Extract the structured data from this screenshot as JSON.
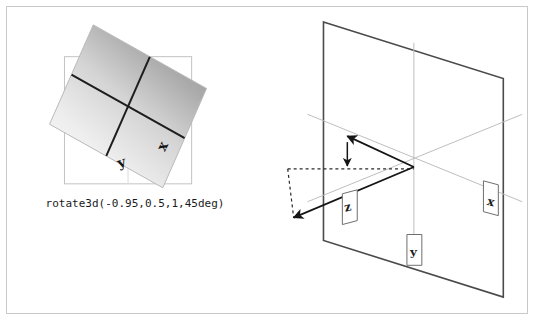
{
  "page": {
    "width": 534,
    "height": 320,
    "background_color": "#ffffff",
    "frame_border_color": "#c9c9c9"
  },
  "colors": {
    "axis_line": "#1a1a1a",
    "plane_outline": "#3a3a3a",
    "guide_line": "#b0b0b0",
    "reference_square": "#c0c0c0",
    "gradient_dark": "#9b9b9b",
    "gradient_light": "#fbfbfb",
    "dashed_line": "#2b2b2b",
    "label_box_fill": "#ffffff",
    "label_box_border": "#6e6e6e",
    "text": "#1a1a1a"
  },
  "left_panel": {
    "name": "rotate3d-result-preview",
    "caption": "rotate3d(-0.95,0.5,1,45deg)",
    "reference_square_label": "untransformed-reference-square",
    "axis_labels": [
      {
        "id": "y",
        "text": "y"
      },
      {
        "id": "x",
        "text": "x"
      }
    ]
  },
  "right_panel": {
    "name": "rotation-axis-3d-diagram",
    "plane_label": "xy-plane",
    "axis_labels": [
      {
        "id": "z",
        "text": "z"
      },
      {
        "id": "y",
        "text": "y"
      },
      {
        "id": "x",
        "text": "x"
      }
    ],
    "vectors": [
      {
        "id": "rotation-axis-vector",
        "style": "solid",
        "arrowheads": 2
      },
      {
        "id": "projection-vector",
        "style": "dashed",
        "arrowheads": 0
      },
      {
        "id": "component-vector",
        "style": "solid",
        "arrowheads": 2
      }
    ]
  }
}
